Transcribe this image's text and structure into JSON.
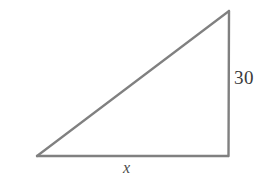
{
  "figure": {
    "background_color": "#ffffff",
    "stroke_color": "#808080",
    "stroke_width": 2,
    "geometry": {
      "type": "right-triangle",
      "right_angle_at": "bottom-right",
      "vertices": {
        "left": [
          37,
          156
        ],
        "bottom_right": [
          228,
          156
        ],
        "apex": [
          229,
          11
        ]
      },
      "sides": {
        "base": "horizontal bottom edge from left vertex to bottom-right vertex",
        "vertical_leg": "vertical right edge from bottom-right vertex to apex",
        "hypotenuse": "diagonal from left vertex to apex"
      }
    },
    "labels": {
      "vertical_leg": "30",
      "base": "x"
    }
  }
}
